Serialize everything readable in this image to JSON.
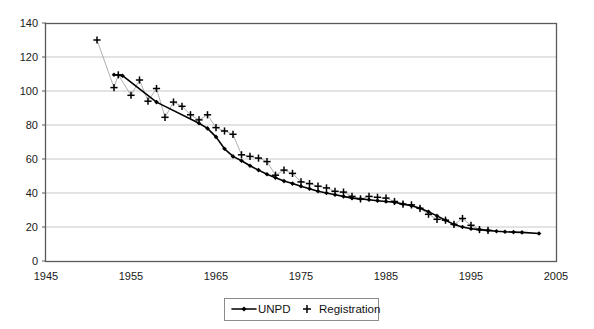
{
  "chart_data": {
    "type": "line",
    "title": "",
    "subtitle": "",
    "xlabel": "",
    "ylabel": "",
    "xlim": [
      1945,
      2005
    ],
    "ylim": [
      0,
      140
    ],
    "grid": true,
    "grid_axis": "y",
    "legend_position": "bottom-center",
    "x_ticks": [
      1945,
      1955,
      1965,
      1975,
      1985,
      1995,
      2005
    ],
    "y_ticks": [
      0,
      20,
      40,
      60,
      80,
      100,
      120,
      140
    ],
    "series": [
      {
        "name": "UNPD",
        "marker": "diamond",
        "line": "solid",
        "color": "#000000",
        "x": [
          1953,
          1954,
          1958,
          1963,
          1964,
          1965,
          1966,
          1967,
          1968,
          1969,
          1970,
          1971,
          1972,
          1973,
          1974,
          1975,
          1976,
          1977,
          1978,
          1979,
          1980,
          1981,
          1982,
          1983,
          1984,
          1985,
          1986,
          1987,
          1988,
          1989,
          1990,
          1991,
          1992,
          1993,
          1994,
          1995,
          1996,
          1997,
          1998,
          1999,
          2000,
          2001,
          2003
        ],
        "values": [
          109.5,
          109.0,
          93.5,
          81.0,
          78.0,
          73.0,
          66.0,
          61.5,
          59.0,
          56.0,
          53.5,
          51.0,
          49.0,
          47.0,
          45.5,
          44.0,
          42.5,
          41.0,
          40.0,
          39.0,
          38.0,
          37.0,
          36.5,
          36.0,
          35.5,
          35.0,
          34.5,
          33.5,
          32.5,
          31.0,
          29.0,
          26.5,
          24.0,
          21.5,
          20.0,
          19.0,
          18.5,
          18.0,
          17.5,
          17.2,
          17.0,
          16.8,
          16.2
        ]
      },
      {
        "name": "Registration",
        "marker": "plus",
        "line": "none",
        "color": "#000000",
        "x": [
          1951,
          1953,
          1953.5,
          1955,
          1956,
          1957,
          1958,
          1959,
          1960,
          1961,
          1962,
          1963,
          1964,
          1965,
          1966,
          1967,
          1968,
          1969,
          1970,
          1971,
          1972,
          1973,
          1974,
          1975,
          1976,
          1977,
          1978,
          1979,
          1980,
          1981,
          1982,
          1983,
          1984,
          1985,
          1986,
          1987,
          1988,
          1989,
          1990,
          1991,
          1992,
          1993,
          1994,
          1995,
          1996,
          1997
        ],
        "values": [
          130.0,
          102.0,
          109.5,
          97.5,
          106.5,
          94.0,
          101.5,
          84.5,
          93.5,
          91.0,
          86.0,
          83.0,
          86.0,
          78.5,
          76.5,
          74.5,
          62.5,
          61.5,
          60.5,
          58.5,
          50.5,
          53.5,
          51.5,
          46.5,
          45.5,
          44.0,
          43.0,
          41.0,
          40.5,
          38.0,
          36.5,
          38.0,
          37.5,
          37.0,
          35.0,
          33.5,
          33.0,
          31.0,
          27.5,
          24.5,
          24.0,
          21.5,
          25.0,
          21.0,
          18.5,
          18.0
        ]
      }
    ],
    "legend": [
      {
        "label": "UNPD",
        "marker": "line-diamond"
      },
      {
        "label": "Registration",
        "marker": "plus"
      }
    ]
  },
  "colors": {
    "series": "#000000",
    "grid": "#b9b9b9",
    "axis": "#5a5a5a",
    "connector": "#8d8d8d",
    "background": "#ffffff"
  }
}
